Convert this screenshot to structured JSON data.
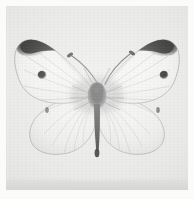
{
  "image": {
    "kind": "photograph",
    "medium": "grayscale-photograph",
    "subject_common_name": "Cabbage White Butterfly",
    "subject_description": "Pinned butterfly specimen photographed dorsally with wings spread",
    "orientation": "dorsal",
    "width_px": 194,
    "height_px": 199,
    "alt_text": "Grayscale photograph of a white butterfly specimen with wings spread, showing dark wing tips and a black spot on each forewing"
  },
  "palette": {
    "paper": "#fbfbfa",
    "plate_background": "#e9e9e7",
    "plate_footer_band": "#d6d6d4",
    "wing_white": "#f4f4f2",
    "wing_shadow": "#d8d8d6",
    "wing_edge_line": "#8e8e8c",
    "vein_gray": "#b4b4b2",
    "apex_black": "#1a1a1a",
    "spot_black": "#101010",
    "body_black": "#141414",
    "antenna_gray": "#3c3c3c"
  },
  "composition": {
    "plate": {
      "x": 6,
      "y": 6,
      "width": 182,
      "height": 184
    },
    "subject_bounds": {
      "x": 14,
      "y": 22,
      "width": 168,
      "height": 133
    },
    "body_axis_x": 97,
    "thorax_center": {
      "x": 97,
      "y": 95
    },
    "abdomen_tip": {
      "x": 97,
      "y": 152
    }
  },
  "markings": {
    "forewing_apex": {
      "label": "dark sooty apical patch",
      "count": 2,
      "color": "#1a1a1a"
    },
    "forewing_discal_spots": {
      "label": "round black discal spot",
      "count": 2,
      "left": {
        "cx": 36,
        "cy": 69,
        "r": 4.2
      },
      "right": {
        "cx": 158,
        "cy": 69,
        "r": 4.2
      },
      "color": "#101010"
    },
    "hindwing_marks": {
      "label": "small faint dark costal mark",
      "count": 2,
      "left": {
        "cx": 41,
        "cy": 104
      },
      "right": {
        "cx": 152,
        "cy": 104
      }
    },
    "antennae": {
      "label": "clubbed antennae",
      "count": 2,
      "tip_color": "#2a2a2a"
    }
  }
}
